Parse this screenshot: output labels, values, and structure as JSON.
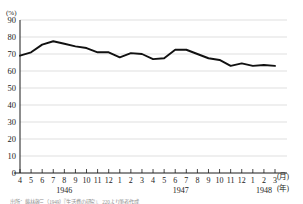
{
  "chart_data": {
    "type": "line",
    "title": "",
    "xlabel": "(月)",
    "ylabel": "(%)",
    "yunit": "(%)",
    "xunit_month": "(月)",
    "xunit_year": "(年)",
    "ylim": [
      0,
      90
    ],
    "ytick_labels": [
      "0",
      "10",
      "20",
      "30",
      "40",
      "50",
      "60",
      "70",
      "80",
      "90"
    ],
    "ytick_values": [
      0,
      10,
      20,
      30,
      40,
      50,
      60,
      70,
      80,
      90
    ],
    "grid": true,
    "legend": "none",
    "x_tick_labels": [
      "4",
      "5",
      "6",
      "7",
      "8",
      "9",
      "10",
      "11",
      "12",
      "1",
      "2",
      "3",
      "4",
      "5",
      "6",
      "7",
      "8",
      "9",
      "10",
      "11",
      "12",
      "1",
      "2",
      "3"
    ],
    "year_groups": [
      {
        "label": "1946",
        "start_index": 0,
        "end_index": 8
      },
      {
        "label": "1947",
        "start_index": 9,
        "end_index": 20
      },
      {
        "label": "1948",
        "start_index": 21,
        "end_index": 23
      }
    ],
    "categories": [
      "1946-4",
      "1946-5",
      "1946-6",
      "1946-7",
      "1946-8",
      "1946-9",
      "1946-10",
      "1946-11",
      "1946-12",
      "1947-1",
      "1947-2",
      "1947-3",
      "1947-4",
      "1947-5",
      "1947-6",
      "1947-7",
      "1947-8",
      "1947-9",
      "1947-10",
      "1947-11",
      "1947-12",
      "1948-1",
      "1948-2",
      "1948-3"
    ],
    "values": [
      69.0,
      71.0,
      75.5,
      77.5,
      76.0,
      74.5,
      73.5,
      71.0,
      71.0,
      68.0,
      70.5,
      70.0,
      67.0,
      67.5,
      72.5,
      72.5,
      70.0,
      67.5,
      66.5,
      63.0,
      64.5,
      63.0,
      63.5,
      63.0
    ]
  },
  "source": {
    "note": "出所：藤林敬三（1949）『生活費の研究』、220より筆者作成"
  }
}
